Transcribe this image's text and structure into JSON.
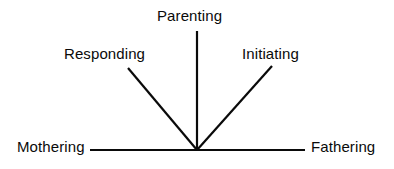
{
  "diagram": {
    "type": "radial-axes-diagram",
    "background_color": "#ffffff",
    "line_color": "#0a0a0a",
    "text_color": "#0a0a0a",
    "vertex": {
      "x": 197,
      "y": 150
    },
    "labels": {
      "parenting": "Parenting",
      "responding": "Responding",
      "initiating": "Initiating",
      "mothering": "Mothering",
      "fathering": "Fathering"
    },
    "rays": [
      {
        "name": "mothering-ray",
        "label": "Mothering",
        "x1": 90,
        "y1": 150,
        "x2": 197,
        "y2": 150
      },
      {
        "name": "responding-ray",
        "label": "Responding",
        "x1": 128,
        "y1": 68,
        "x2": 197,
        "y2": 150
      },
      {
        "name": "parenting-ray",
        "label": "Parenting",
        "x1": 197,
        "y1": 31,
        "x2": 197,
        "y2": 150
      },
      {
        "name": "initiating-ray",
        "label": "Initiating",
        "x1": 272,
        "y1": 66,
        "x2": 197,
        "y2": 150
      },
      {
        "name": "fathering-ray",
        "label": "Fathering",
        "x1": 197,
        "y1": 150,
        "x2": 305,
        "y2": 150
      }
    ]
  }
}
